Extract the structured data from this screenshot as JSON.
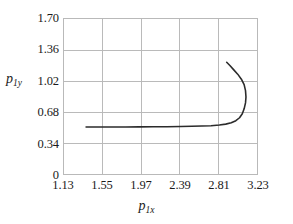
{
  "chart_data": {
    "type": "line",
    "title": "",
    "subtitle": "",
    "xlabel": "p1x",
    "ylabel": "p1y",
    "xlabel_base": "p",
    "xlabel_sub": "1x",
    "ylabel_base": "p",
    "ylabel_sub": "1y",
    "xlim": [
      1.13,
      3.23
    ],
    "ylim": [
      0,
      1.7
    ],
    "xticks": [
      "1.13",
      "1.55",
      "1.97",
      "2.39",
      "2.81",
      "3.23"
    ],
    "yticks": [
      "0",
      "0.34",
      "0.68",
      "1.02",
      "1.36",
      "1.70"
    ],
    "xtick_values": [
      1.13,
      1.55,
      1.97,
      2.39,
      2.81,
      3.23
    ],
    "ytick_values": [
      0,
      0.34,
      0.68,
      1.02,
      1.36,
      1.7
    ],
    "grid": true,
    "grid_color": "#b9b9b9",
    "legend": "none",
    "series": [
      {
        "name": "p1y vs p1x",
        "color": "#2b2b2b",
        "x": [
          1.37,
          1.5,
          1.65,
          1.8,
          1.95,
          2.1,
          2.25,
          2.4,
          2.52,
          2.63,
          2.73,
          2.82,
          2.89,
          2.95,
          3.0,
          3.04,
          3.07,
          3.09,
          3.105,
          3.11,
          3.105,
          3.09,
          3.06,
          3.02,
          2.975,
          2.935,
          2.9
        ],
        "y": [
          0.515,
          0.515,
          0.515,
          0.516,
          0.517,
          0.518,
          0.519,
          0.521,
          0.523,
          0.526,
          0.53,
          0.537,
          0.547,
          0.562,
          0.585,
          0.617,
          0.66,
          0.715,
          0.78,
          0.845,
          0.915,
          0.98,
          1.04,
          1.095,
          1.145,
          1.19,
          1.225
        ]
      }
    ]
  }
}
